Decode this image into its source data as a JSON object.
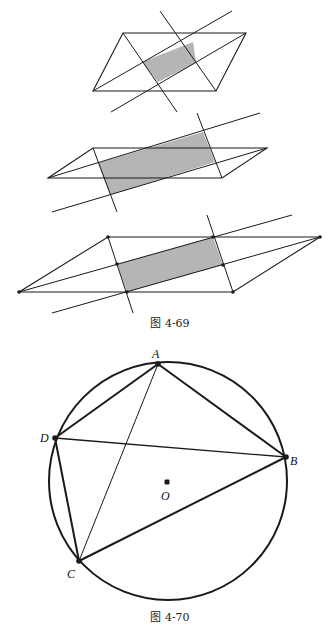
{
  "colors": {
    "stroke": "#1a1a1a",
    "shade": "#b5b5b5",
    "background": "#ffffff"
  },
  "figure_4_69": {
    "caption": "图 4-69",
    "caption_pos": [
      170,
      327
    ],
    "panels": [
      {
        "name": "panel-1",
        "parallelogram": [
          [
            123,
            33
          ],
          [
            246,
            33
          ],
          [
            216,
            91
          ],
          [
            93,
            91
          ]
        ],
        "shaded": [
          [
            142,
            62
          ],
          [
            193,
            42
          ],
          [
            196,
            63
          ],
          [
            158,
            82
          ]
        ],
        "lines": [
          [
            [
              93,
              91
            ],
            [
              232,
              11
            ]
          ],
          [
            [
              111,
              112
            ],
            [
              246,
              33
            ]
          ],
          [
            [
              160,
              11
            ],
            [
              216,
              91
            ]
          ],
          [
            [
              123,
              33
            ],
            [
              177,
              112
            ]
          ]
        ],
        "dots": []
      },
      {
        "name": "panel-2",
        "parallelogram": [
          [
            93,
            148
          ],
          [
            267,
            148
          ],
          [
            222,
            178
          ],
          [
            48,
            178
          ]
        ],
        "shaded": [
          [
            98,
            163
          ],
          [
            203,
            132
          ],
          [
            215,
            162
          ],
          [
            110,
            195
          ]
        ],
        "lines": [
          [
            [
              48,
              178
            ],
            [
              260,
              113
            ]
          ],
          [
            [
              52,
              212
            ],
            [
              267,
              148
            ]
          ],
          [
            [
              93,
              148
            ],
            [
              117,
              212
            ]
          ],
          [
            [
              197,
              113
            ],
            [
              222,
              178
            ]
          ]
        ],
        "dots": []
      },
      {
        "name": "panel-3",
        "parallelogram": [
          [
            108,
            237
          ],
          [
            320,
            237
          ],
          [
            233,
            292
          ],
          [
            19,
            292
          ]
        ],
        "shaded": [
          [
            117,
            264
          ],
          [
            213,
            237
          ],
          [
            223,
            265
          ],
          [
            127,
            292
          ]
        ],
        "lines": [
          [
            [
              19,
              292
            ],
            [
              292,
              215
            ]
          ],
          [
            [
              52,
              313
            ],
            [
              320,
              237
            ]
          ],
          [
            [
              108,
              237
            ],
            [
              133,
              313
            ]
          ],
          [
            [
              207,
              215
            ],
            [
              233,
              292
            ]
          ]
        ],
        "dots": [
          [
            108,
            237
          ],
          [
            320,
            237
          ],
          [
            233,
            292
          ],
          [
            19,
            292
          ],
          [
            117,
            264
          ],
          [
            213,
            237
          ],
          [
            223,
            265
          ],
          [
            127,
            292
          ]
        ]
      }
    ]
  },
  "figure_4_70": {
    "caption": "图 4-70",
    "caption_pos": [
      170,
      621
    ],
    "circle": {
      "cx": 168,
      "cy": 481,
      "r": 119
    },
    "points": {
      "A": {
        "x": 158,
        "y": 364,
        "label": "A",
        "label_pos": [
          152,
          358
        ]
      },
      "B": {
        "x": 286,
        "y": 457,
        "label": "B",
        "label_pos": [
          290,
          465
        ]
      },
      "C": {
        "x": 79,
        "y": 561,
        "label": "C",
        "label_pos": [
          67,
          578
        ]
      },
      "D": {
        "x": 55,
        "y": 438,
        "label": "D",
        "label_pos": [
          40,
          442
        ]
      },
      "O": {
        "x": 167,
        "y": 482,
        "label": "O",
        "label_pos": [
          161,
          500
        ]
      }
    },
    "segments": [
      {
        "from": "A",
        "to": "B",
        "weight": 2
      },
      {
        "from": "A",
        "to": "D",
        "weight": 2
      },
      {
        "from": "D",
        "to": "B",
        "weight": 1.3
      },
      {
        "from": "D",
        "to": "C",
        "weight": 2
      },
      {
        "from": "C",
        "to": "B",
        "weight": 2
      },
      {
        "from": "A",
        "to": "C",
        "weight": 1
      }
    ]
  }
}
